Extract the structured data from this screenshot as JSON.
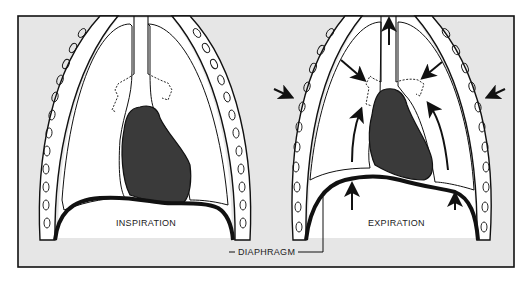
{
  "figure": {
    "background": "#e6e6e6",
    "border_color": "#111111",
    "lung_fill": "#ffffff",
    "heart_fill": "#3a3a3a",
    "panels": [
      {
        "id": "inspiration",
        "label": "INSPIRATION"
      },
      {
        "id": "expiration",
        "label": "EXPIRATION"
      }
    ],
    "shared_label": "DIAPHRAGM",
    "shared_label_prefix": "—"
  }
}
